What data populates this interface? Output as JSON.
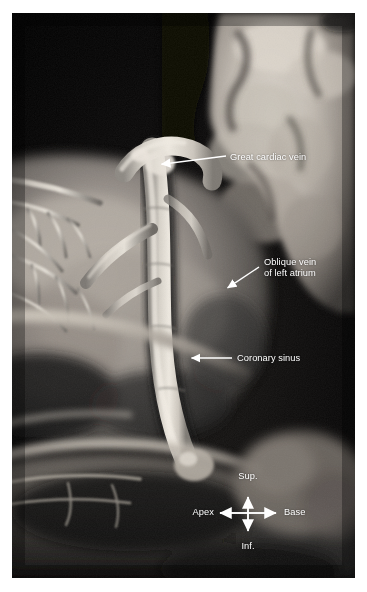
{
  "figure": {
    "kind": "anatomical-photograph",
    "background_color": "#ffffff",
    "plate_background_color": "#050505",
    "annotation_color": "#ffffff"
  },
  "labels": [
    {
      "id": "great-cardiac-vein",
      "text": "Great cardiac vein",
      "lines": [
        "Great cardiac vein"
      ],
      "text_x": 230,
      "text_y": 152,
      "align": "left",
      "leader": {
        "type": "arrow",
        "from_x": 226,
        "from_y": 156,
        "to_x": 156,
        "to_y": 165
      }
    },
    {
      "id": "oblique-vein-of-left-atrium",
      "text": "Oblique vein of left atrium",
      "lines": [
        "Oblique vein",
        "of left atrium"
      ],
      "text_x": 264,
      "text_y": 257,
      "align": "left",
      "leader": {
        "type": "arrow",
        "from_x": 259,
        "from_y": 267,
        "to_x": 223,
        "to_y": 291
      }
    },
    {
      "id": "coronary-sinus",
      "text": "Coronary sinus",
      "lines": [
        "Coronary sinus"
      ],
      "text_x": 237,
      "text_y": 353,
      "align": "left",
      "leader": {
        "type": "arrow",
        "from_x": 232,
        "from_y": 358,
        "to_x": 186,
        "to_y": 358
      }
    }
  ],
  "orientation_compass": {
    "center_x": 248,
    "center_y": 513,
    "arm_up": 23,
    "arm_down": 25,
    "arm_left": 35,
    "arm_right": 35,
    "superior_label": "Sup.",
    "inferior_label": "Inf.",
    "left_label": "Apex",
    "right_label": "Base",
    "superior_label_x": 248,
    "superior_label_y": 471,
    "inferior_label_x": 248,
    "inferior_label_y": 547,
    "left_label_x": 203,
    "left_label_y": 507,
    "right_label_x": 292,
    "right_label_y": 507
  }
}
